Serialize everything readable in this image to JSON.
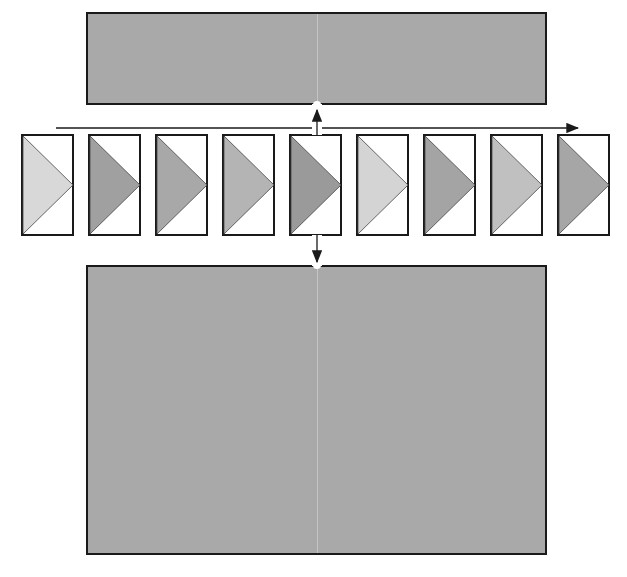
{
  "diagram": {
    "type": "film-strip sequence between two panels",
    "top_panel": {
      "x": 86,
      "y": 12,
      "width": 460,
      "height": 92,
      "fill": "#a9a9a9"
    },
    "bottom_panel": {
      "x": 86,
      "y": 265,
      "width": 460,
      "height": 289,
      "fill": "#a9a9a9"
    },
    "timeline_arrow": {
      "x1": 56,
      "x2": 578,
      "y": 128,
      "direction": "right"
    },
    "connectors": [
      {
        "name": "up-connector",
        "x": 317,
        "y_from": 135,
        "y_to": 104,
        "direction": "up"
      },
      {
        "name": "down-connector",
        "x": 317,
        "y_from": 235,
        "y_to": 265,
        "direction": "down"
      }
    ],
    "frames": [
      {
        "index": 1,
        "x": 22,
        "fill": "#d8d8d8"
      },
      {
        "index": 2,
        "x": 89,
        "fill": "#a0a0a0"
      },
      {
        "index": 3,
        "x": 156,
        "fill": "#a8a8a8"
      },
      {
        "index": 4,
        "x": 223,
        "fill": "#b4b4b4"
      },
      {
        "index": 5,
        "x": 290,
        "fill": "#9a9a9a"
      },
      {
        "index": 6,
        "x": 357,
        "fill": "#d4d4d4"
      },
      {
        "index": 7,
        "x": 424,
        "fill": "#a4a4a4"
      },
      {
        "index": 8,
        "x": 491,
        "fill": "#c0c0c0"
      },
      {
        "index": 9,
        "x": 558,
        "fill": "#a6a6a6"
      }
    ],
    "frame_size": {
      "width": 51,
      "height": 100,
      "y": 135
    },
    "colors": {
      "stroke": "#1a1a1a",
      "background": "#ffffff"
    }
  }
}
